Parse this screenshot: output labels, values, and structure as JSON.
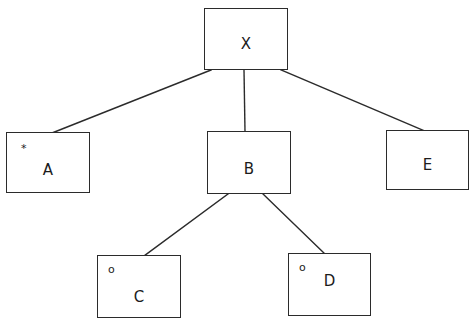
{
  "diagram": {
    "type": "tree",
    "title": "",
    "background_color": "#ffffff",
    "line_color": "#2b2b2b",
    "text_color": "#1c1c1c",
    "nodes": [
      {
        "id": "X",
        "label": "X",
        "marker": "",
        "x": 204,
        "y": 8,
        "width": 84,
        "height": 62,
        "label_offset_y": 28,
        "level": 0
      },
      {
        "id": "A",
        "label": "A",
        "marker": "*",
        "x": 6,
        "y": 132,
        "width": 84,
        "height": 61,
        "label_offset_y": 30,
        "marker_x": 14,
        "marker_y": 10,
        "level": 1
      },
      {
        "id": "B",
        "label": "B",
        "marker": "",
        "x": 207,
        "y": 131,
        "width": 84,
        "height": 63,
        "label_offset_y": 30,
        "level": 1
      },
      {
        "id": "E",
        "label": "E",
        "marker": "",
        "x": 386,
        "y": 130,
        "width": 83,
        "height": 60,
        "label_offset_y": 27,
        "level": 1
      },
      {
        "id": "C",
        "label": "C",
        "marker": "o",
        "x": 97,
        "y": 255,
        "width": 84,
        "height": 63,
        "label_offset_y": 34,
        "marker_x": 10,
        "marker_y": 8,
        "level": 2
      },
      {
        "id": "D",
        "label": "D",
        "marker": "o",
        "x": 288,
        "y": 253,
        "width": 83,
        "height": 63,
        "label_offset_y": 20,
        "marker_x": 10,
        "marker_y": 8,
        "level": 2
      }
    ],
    "edges": [
      {
        "from": "X",
        "to": "A",
        "x1": 211,
        "y1": 70,
        "x2": 52,
        "y2": 133
      },
      {
        "from": "X",
        "to": "B",
        "x1": 244,
        "y1": 70,
        "x2": 245,
        "y2": 131
      },
      {
        "from": "X",
        "to": "E",
        "x1": 281,
        "y1": 70,
        "x2": 425,
        "y2": 131
      },
      {
        "from": "B",
        "to": "C",
        "x1": 228,
        "y1": 194,
        "x2": 144,
        "y2": 256
      },
      {
        "from": "B",
        "to": "D",
        "x1": 263,
        "y1": 194,
        "x2": 325,
        "y2": 254
      }
    ]
  }
}
